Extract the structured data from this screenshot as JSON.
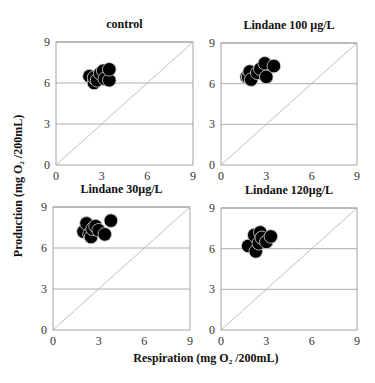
{
  "figure": {
    "ylabel": "Production (mg O₂ /200mL)",
    "xlabel": "Respiration (mg O₂ /200mL)",
    "colors": {
      "point": "#000000",
      "point_edge": "#d8d8d8",
      "grid": "#9a9a9a",
      "diagonal": "#b0b0b0",
      "frame": "#9a9a9a"
    }
  },
  "chart_data": [
    {
      "type": "scatter",
      "title": "control",
      "xlabel": "Respiration (mg O2 /200mL)",
      "ylabel": "Production (mg O2 /200mL)",
      "xlim": [
        0,
        9
      ],
      "ylim": [
        0,
        9
      ],
      "xticks": [
        0,
        3,
        6,
        9
      ],
      "yticks": [
        0,
        3,
        6,
        9
      ],
      "grid": "horizontal",
      "reference_line": "y = x",
      "points": [
        [
          2.2,
          6.5
        ],
        [
          2.5,
          6.0
        ],
        [
          2.5,
          6.4
        ],
        [
          2.7,
          6.2
        ],
        [
          2.9,
          6.7
        ],
        [
          3.1,
          6.9
        ],
        [
          3.2,
          6.3
        ],
        [
          3.5,
          6.2
        ],
        [
          3.5,
          7.0
        ]
      ]
    },
    {
      "type": "scatter",
      "title": "Lindane 100 µg/L",
      "xlabel": "Respiration (mg O2 /200mL)",
      "ylabel": "Production (mg O2 /200mL)",
      "xlim": [
        0,
        9
      ],
      "ylim": [
        0,
        9
      ],
      "xticks": [
        0,
        3,
        6,
        9
      ],
      "yticks": [
        0,
        3,
        6,
        9
      ],
      "grid": "horizontal",
      "reference_line": "y = x",
      "points": [
        [
          1.7,
          6.5
        ],
        [
          1.8,
          6.5
        ],
        [
          1.9,
          6.9
        ],
        [
          2.0,
          6.3
        ],
        [
          2.4,
          6.8
        ],
        [
          2.6,
          7.1
        ],
        [
          2.9,
          7.5
        ],
        [
          3.0,
          6.5
        ],
        [
          3.5,
          7.3
        ]
      ]
    },
    {
      "type": "scatter",
      "title": "Lindane 30µg/L",
      "xlabel": "Respiration (mg O2 /200mL)",
      "ylabel": "Production (mg O2 /200mL)",
      "xlim": [
        0,
        9
      ],
      "ylim": [
        0,
        9
      ],
      "xticks": [
        0,
        3,
        6,
        9
      ],
      "yticks": [
        0,
        3,
        6,
        9
      ],
      "grid": "horizontal",
      "reference_line": "y = x",
      "points": [
        [
          2.0,
          7.2
        ],
        [
          2.2,
          7.8
        ],
        [
          2.4,
          7.0
        ],
        [
          2.5,
          6.8
        ],
        [
          2.6,
          7.4
        ],
        [
          2.8,
          7.6
        ],
        [
          3.0,
          7.3
        ],
        [
          3.4,
          7.0
        ],
        [
          3.8,
          8.0
        ]
      ]
    },
    {
      "type": "scatter",
      "title": "Lindane 120µg/L",
      "xlabel": "Respiration (mg O2 /200mL)",
      "ylabel": "Production (mg O2 /200mL)",
      "xlim": [
        0,
        9
      ],
      "ylim": [
        0,
        9
      ],
      "xticks": [
        0,
        3,
        6,
        9
      ],
      "yticks": [
        0,
        3,
        6,
        9
      ],
      "grid": "horizontal",
      "reference_line": "y = x",
      "points": [
        [
          1.8,
          6.2
        ],
        [
          2.3,
          5.8
        ],
        [
          2.2,
          7.0
        ],
        [
          2.5,
          6.4
        ],
        [
          2.6,
          7.2
        ],
        [
          2.7,
          6.8
        ],
        [
          3.0,
          6.5
        ],
        [
          3.3,
          6.9
        ]
      ]
    }
  ]
}
